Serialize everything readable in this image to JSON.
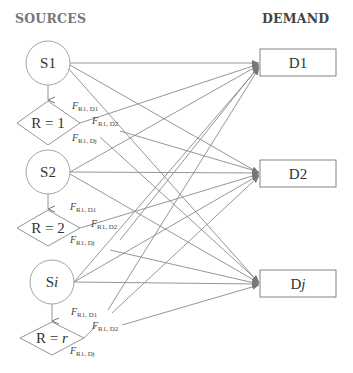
{
  "headers": {
    "sources": "SOURCES",
    "demand": "DEMAND"
  },
  "sources": [
    {
      "id": "S1",
      "label_main": "S1",
      "label_italic": "",
      "rule_main": "R = 1",
      "rule_italic": ""
    },
    {
      "id": "S2",
      "label_main": "S2",
      "label_italic": "",
      "rule_main": "R = 2",
      "rule_italic": ""
    },
    {
      "id": "Si",
      "label_main": "S",
      "label_italic": "i",
      "rule_main": "R = ",
      "rule_italic": "r"
    }
  ],
  "demands": [
    {
      "id": "D1",
      "label_main": "D1",
      "label_italic": ""
    },
    {
      "id": "D2",
      "label_main": "D2",
      "label_italic": ""
    },
    {
      "id": "Dj",
      "label_main": "D",
      "label_italic": "j"
    }
  ],
  "flow_labels": {
    "f": "F",
    "d1": "R1, D1",
    "d2": "R1, D2",
    "dj": "R1, Dj"
  },
  "colors": {
    "stroke": "#8a8a8a",
    "text": "#333333",
    "header_sources": "#777777",
    "header_demand": "#444444"
  }
}
